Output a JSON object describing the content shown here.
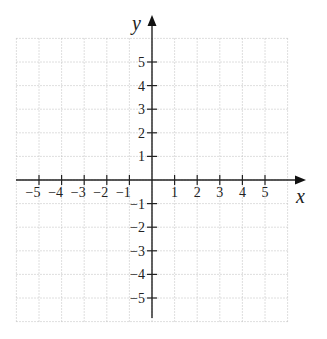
{
  "diagram": {
    "type": "coordinate-plane",
    "x_axis": {
      "label": "x",
      "min": -6,
      "max": 6,
      "tick_labels": [
        "-5",
        "-4",
        "-3",
        "-2",
        "-1",
        "1",
        "2",
        "3",
        "4",
        "5"
      ]
    },
    "y_axis": {
      "label": "y",
      "min": -6,
      "max": 6,
      "tick_labels": [
        "5",
        "4",
        "3",
        "2",
        "1",
        "-1",
        "-2",
        "-3",
        "-4",
        "-5"
      ]
    },
    "grid": {
      "on": true,
      "style": "dotted",
      "color": "#bbbbbb"
    },
    "axis_color": "#222222"
  }
}
